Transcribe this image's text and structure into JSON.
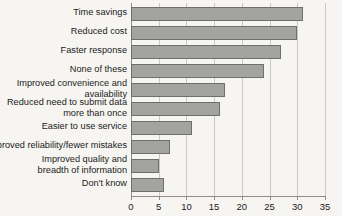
{
  "chart_data": {
    "type": "bar",
    "orientation": "horizontal",
    "title": "",
    "subtitle": "",
    "xlabel": "",
    "ylabel": "",
    "xlim": [
      0,
      35
    ],
    "xticks": [
      0,
      5,
      10,
      15,
      20,
      25,
      30,
      35
    ],
    "xtick_labels": [
      "0",
      "5",
      "10",
      "15",
      "20",
      "25",
      "30",
      "35"
    ],
    "grid": true,
    "legend": false,
    "categories": [
      "Time savings",
      "Reduced cost",
      "Faster response",
      "None of these",
      "Improved convenience and\navailability",
      "Reduced need to submit data\nmore than once",
      "Easier to use service",
      "Improved reliability/fewer mistakes",
      "Improved quality and\nbreadth of information",
      "Don't know"
    ],
    "values": [
      31,
      30,
      27,
      24,
      17,
      16,
      11,
      7,
      5,
      6
    ],
    "colors": {
      "bar_fill": "#a3a3a1",
      "bar_border": "#6f6f6d",
      "gridline": "#c9c8c4",
      "axis": "#8e8d89",
      "background": "#f6f5f2",
      "text": "#1b1b1b"
    }
  }
}
